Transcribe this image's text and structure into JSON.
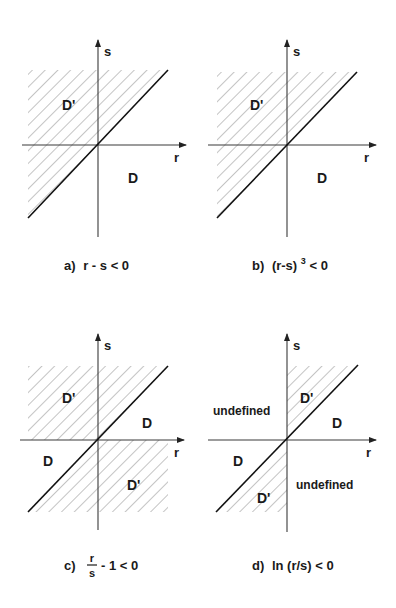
{
  "figure": {
    "panels": [
      {
        "id": "a",
        "caption": "a) r - s < 0",
        "caption_parts": {
          "prefix": "a)",
          "expr": "r - s < 0"
        },
        "axes": {
          "x_label": "r",
          "y_label": "s"
        },
        "regions": [
          {
            "label": "D'",
            "hatched": true
          },
          {
            "label": "D",
            "hatched": false
          }
        ]
      },
      {
        "id": "b",
        "caption": "b) (r-s)^3 < 0",
        "caption_parts": {
          "prefix": "b)",
          "expr_base": "(r-s)",
          "exponent": "3",
          "expr_rest": "< 0"
        },
        "axes": {
          "x_label": "r",
          "y_label": "s"
        },
        "regions": [
          {
            "label": "D'",
            "hatched": true
          },
          {
            "label": "D",
            "hatched": false
          }
        ]
      },
      {
        "id": "c",
        "caption": "c) r/s - 1 < 0",
        "caption_parts": {
          "prefix": "c)",
          "numerator": "r",
          "denominator": "s",
          "expr_rest": "- 1 < 0"
        },
        "axes": {
          "x_label": "r",
          "y_label": "s"
        },
        "regions": [
          {
            "label": "D'",
            "hatched": true,
            "position": "upper-left"
          },
          {
            "label": "D",
            "hatched": false,
            "position": "upper-right"
          },
          {
            "label": "D",
            "hatched": false,
            "position": "lower-left"
          },
          {
            "label": "D'",
            "hatched": true,
            "position": "lower-right"
          }
        ]
      },
      {
        "id": "d",
        "caption": "d) ln (r/s) < 0",
        "caption_parts": {
          "prefix": "d)",
          "expr": "ln (r/s) < 0"
        },
        "axes": {
          "x_label": "r",
          "y_label": "s"
        },
        "regions": [
          {
            "label": "undefined",
            "hatched": false,
            "position": "upper-left"
          },
          {
            "label": "D'",
            "hatched": true,
            "position": "upper-right-wedge"
          },
          {
            "label": "D",
            "hatched": false,
            "position": "right"
          },
          {
            "label": "D",
            "hatched": false,
            "position": "left"
          },
          {
            "label": "D'",
            "hatched": true,
            "position": "lower-left-wedge"
          },
          {
            "label": "undefined",
            "hatched": false,
            "position": "lower-right"
          }
        ]
      }
    ]
  }
}
